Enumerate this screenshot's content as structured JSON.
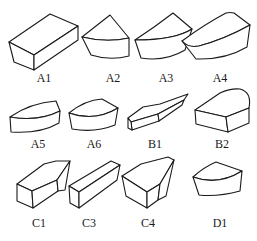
{
  "figure": {
    "stroke_color": "#1a1a1a",
    "background": "#ffffff",
    "rows": [
      {
        "items": [
          {
            "id": "A1",
            "label": "A1",
            "shape": "rectangular-block"
          },
          {
            "id": "A2",
            "label": "A2",
            "shape": "sector-block"
          },
          {
            "id": "A3",
            "label": "A3",
            "shape": "wide-sector-block"
          },
          {
            "id": "A4",
            "label": "A4",
            "shape": "rounded-wedge-block"
          }
        ]
      },
      {
        "items": [
          {
            "id": "A5",
            "label": "A5",
            "shape": "flat-arc-block"
          },
          {
            "id": "A6",
            "label": "A6",
            "shape": "small-sector-block"
          },
          {
            "id": "B1",
            "label": "B1",
            "shape": "elongated-pointed-block"
          },
          {
            "id": "B2",
            "label": "B2",
            "shape": "half-round-block"
          }
        ]
      },
      {
        "items": [
          {
            "id": "C1",
            "label": "C1",
            "shape": "pointed-prism-block"
          },
          {
            "id": "C3",
            "label": "C3",
            "shape": "long-rectangular-block"
          },
          {
            "id": "C4",
            "label": "C4",
            "shape": "chamfered-block"
          },
          {
            "id": "D1",
            "label": "D1",
            "shape": "sector-block"
          }
        ]
      }
    ]
  }
}
